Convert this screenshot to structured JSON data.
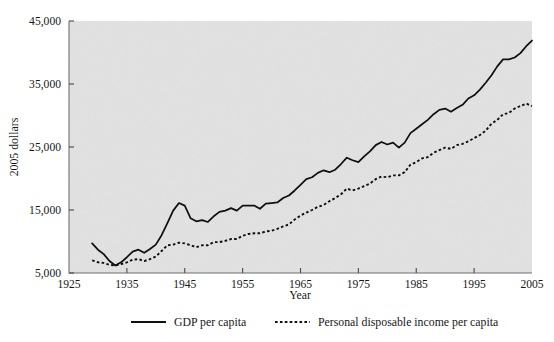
{
  "chart_data": {
    "type": "line",
    "title": "",
    "xlabel": "Year",
    "ylabel": "2005 dollars",
    "xlim": [
      1925,
      2005
    ],
    "ylim": [
      5000,
      45000
    ],
    "xticks": [
      1925,
      1935,
      1945,
      1955,
      1965,
      1975,
      1985,
      1995,
      2005
    ],
    "xtick_labels": [
      "1925",
      "1935",
      "1945",
      "1955",
      "1965",
      "1975",
      "1985",
      "1995",
      "2005"
    ],
    "yticks": [
      5000,
      15000,
      25000,
      35000,
      45000
    ],
    "ytick_labels": [
      "5,000",
      "15,000",
      "25,000",
      "35,000",
      "45,000"
    ],
    "grid": false,
    "legend_position": "below",
    "background": "#e2e2e2",
    "series": [
      {
        "name": "GDP per capita",
        "style": "solid",
        "color": "#101010",
        "x": [
          1929,
          1930,
          1931,
          1932,
          1933,
          1934,
          1935,
          1936,
          1937,
          1938,
          1939,
          1940,
          1941,
          1942,
          1943,
          1944,
          1945,
          1946,
          1947,
          1948,
          1949,
          1950,
          1951,
          1952,
          1953,
          1954,
          1955,
          1956,
          1957,
          1958,
          1959,
          1960,
          1961,
          1962,
          1963,
          1964,
          1965,
          1966,
          1967,
          1968,
          1969,
          1970,
          1971,
          1972,
          1973,
          1974,
          1975,
          1976,
          1977,
          1978,
          1979,
          1980,
          1981,
          1982,
          1983,
          1984,
          1985,
          1986,
          1987,
          1988,
          1989,
          1990,
          1991,
          1992,
          1993,
          1994,
          1995,
          1996,
          1997,
          1998,
          1999,
          2000,
          2001,
          2002,
          2003,
          2004,
          2005
        ],
        "y": [
          9700,
          8700,
          8000,
          6900,
          6200,
          6700,
          7500,
          8400,
          8700,
          8200,
          8800,
          9500,
          11000,
          12900,
          14900,
          16100,
          15700,
          13700,
          13200,
          13400,
          13100,
          14000,
          14700,
          14900,
          15300,
          14900,
          15700,
          15700,
          15700,
          15200,
          16000,
          16100,
          16200,
          16900,
          17300,
          18100,
          19000,
          19900,
          20200,
          20900,
          21300,
          21000,
          21400,
          22300,
          23300,
          22900,
          22600,
          23500,
          24300,
          25300,
          25800,
          25400,
          25700,
          24900,
          25700,
          27200,
          27900,
          28600,
          29300,
          30200,
          30900,
          31100,
          30600,
          31200,
          31700,
          32700,
          33200,
          34100,
          35200,
          36400,
          37800,
          38900,
          38900,
          39200,
          39900,
          41000,
          41900
        ]
      },
      {
        "name": "Personal disposable income per capita",
        "style": "dashed",
        "color": "#101010",
        "x": [
          1929,
          1930,
          1931,
          1932,
          1933,
          1934,
          1935,
          1936,
          1937,
          1938,
          1939,
          1940,
          1941,
          1942,
          1943,
          1944,
          1945,
          1946,
          1947,
          1948,
          1949,
          1950,
          1951,
          1952,
          1953,
          1954,
          1955,
          1956,
          1957,
          1958,
          1959,
          1960,
          1961,
          1962,
          1963,
          1964,
          1965,
          1966,
          1967,
          1968,
          1969,
          1970,
          1971,
          1972,
          1973,
          1974,
          1975,
          1976,
          1977,
          1978,
          1979,
          1980,
          1981,
          1982,
          1983,
          1984,
          1985,
          1986,
          1987,
          1988,
          1989,
          1990,
          1991,
          1992,
          1993,
          1994,
          1995,
          1996,
          1997,
          1998,
          1999,
          2000,
          2001,
          2002,
          2003,
          2004,
          2005
        ],
        "y": [
          7000,
          6700,
          6600,
          6300,
          6200,
          6400,
          6700,
          7100,
          7200,
          6900,
          7200,
          7600,
          8500,
          9400,
          9500,
          9800,
          9700,
          9400,
          9100,
          9400,
          9400,
          9900,
          9900,
          10100,
          10400,
          10400,
          10900,
          11200,
          11300,
          11300,
          11600,
          11700,
          12000,
          12400,
          12700,
          13500,
          14100,
          14600,
          15000,
          15500,
          15800,
          16400,
          16900,
          17500,
          18400,
          18100,
          18400,
          18800,
          19200,
          19900,
          20300,
          20200,
          20500,
          20500,
          21000,
          22200,
          22600,
          23200,
          23400,
          24100,
          24500,
          24900,
          24700,
          25300,
          25500,
          25900,
          26400,
          26900,
          27600,
          28700,
          29300,
          30200,
          30400,
          31100,
          31500,
          31900,
          31500
        ]
      }
    ],
    "legend": [
      {
        "label": "GDP per capita",
        "style": "solid"
      },
      {
        "label": "Personal disposable income per capita",
        "style": "dashed"
      }
    ]
  }
}
